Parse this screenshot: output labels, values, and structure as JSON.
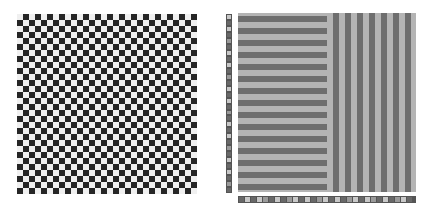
{
  "colors": {
    "background": "#ffffff",
    "checker_dark": "#262626",
    "checker_light": "#f0f0f0",
    "stripe_dark": "#6e6e6e",
    "stripe_light": "#b4b4b4",
    "strip_border": "#555555",
    "strip_light": "#c8c8c8",
    "strip_mid": "#9a9a9a",
    "strip_dark": "#686868"
  },
  "left_pattern": {
    "type": "checkerboard",
    "rows": 30,
    "cols": 30,
    "cell_px": 6
  },
  "right_pattern": {
    "horizontal_stripes": {
      "count": 15,
      "period_px": 12,
      "thickness_px": 6
    },
    "vertical_stripes": {
      "count": 7,
      "period_px": 12,
      "thickness_px": 6
    },
    "left_strip_cells": [
      "light",
      "dark",
      "light",
      "dark",
      "mid",
      "dark",
      "light",
      "dark",
      "light",
      "dark",
      "mid",
      "dark",
      "light",
      "dark",
      "light",
      "dark",
      "mid",
      "dark",
      "light",
      "dark",
      "light",
      "dark",
      "mid",
      "dark",
      "light",
      "dark",
      "light",
      "dark",
      "mid",
      "dark"
    ],
    "bottom_strip_cells": [
      "dark",
      "light",
      "dark",
      "light",
      "mid",
      "dark",
      "light",
      "dark",
      "mid",
      "light",
      "dark",
      "light",
      "dark",
      "mid",
      "light",
      "dark",
      "light",
      "dark",
      "mid",
      "light",
      "dark",
      "light",
      "mid",
      "dark",
      "light",
      "dark",
      "mid",
      "light",
      "dark"
    ]
  }
}
